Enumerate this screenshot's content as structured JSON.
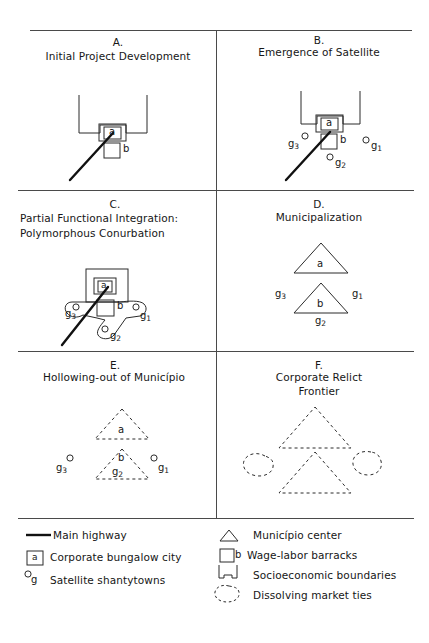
{
  "figure": {
    "type": "six-panel conceptual diagram",
    "panels": [
      {
        "id": "A",
        "letter": "A.",
        "title_lines": [
          "Initial Project Development"
        ],
        "align": "center",
        "elements": {
          "corporate_city_label": "a",
          "barracks_label": "b",
          "highway": true,
          "boundary": true,
          "satellites": []
        }
      },
      {
        "id": "B",
        "letter": "B.",
        "title_lines": [
          "Emergence of Satellite"
        ],
        "align": "center",
        "elements": {
          "corporate_city_label": "a",
          "barracks_label": "b",
          "highway": true,
          "boundary": true,
          "satellites": [
            "g1",
            "g2",
            "g3"
          ]
        }
      },
      {
        "id": "C",
        "letter": "C.",
        "title_lines": [
          "Partial Functional Integration:",
          "Polymorphous Conurbation"
        ],
        "align": "left",
        "elements": {
          "corporate_city_label": "a",
          "barracks_label": "b",
          "highway": true,
          "boundary": true,
          "conurbation_outline": true,
          "satellites": [
            "g1",
            "g2",
            "g3"
          ]
        }
      },
      {
        "id": "D",
        "letter": "D.",
        "title_lines": [
          "Municipalization"
        ],
        "align": "center",
        "elements": {
          "municipio_a_label": "a",
          "municipio_b_label": "b",
          "highway": false,
          "satellites": [
            "g1",
            "g2",
            "g3"
          ]
        }
      },
      {
        "id": "E",
        "letter": "E.",
        "title_lines": [
          "Hollowing-out of Município"
        ],
        "align": "center",
        "elements": {
          "municipio_a_label": "a",
          "municipio_b_label": "b",
          "dashed": true,
          "satellites": [
            "g1",
            "g2",
            "g3"
          ]
        }
      },
      {
        "id": "F",
        "letter": "F.",
        "title_lines": [
          "Corporate Relict",
          "Frontier"
        ],
        "align": "center",
        "elements": {
          "dashed": true,
          "dissolving_blobs": 2,
          "dashed_triangles": 2,
          "satellites": []
        }
      }
    ],
    "subscripts": {
      "g1": "1",
      "g2": "2",
      "g3": "3",
      "g_base": "g"
    }
  },
  "legend": {
    "left_column": [
      {
        "icon": "thick-line-icon",
        "label": "Main highway"
      },
      {
        "icon": "boxed-a-icon",
        "label": "Corporate bungalow city"
      },
      {
        "icon": "circle-g-icon",
        "label": "Satellite shantytowns"
      }
    ],
    "right_column": [
      {
        "icon": "triangle-icon",
        "label": "Município center"
      },
      {
        "icon": "square-b-icon",
        "label": "Wage-labor barracks"
      },
      {
        "icon": "bracket-icon",
        "label": "Socioeconomic boundaries"
      },
      {
        "icon": "dashed-blob-icon",
        "label": "Dissolving market ties"
      }
    ]
  },
  "colors": {
    "ink": "#161616",
    "rule": "#4a4a4a",
    "background": "#ffffff"
  }
}
